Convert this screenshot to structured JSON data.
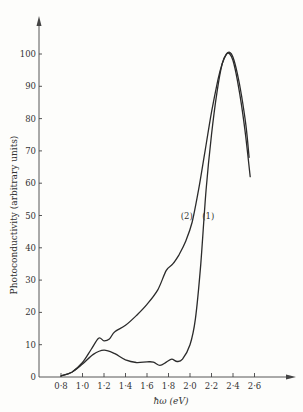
{
  "chart_data": {
    "type": "line",
    "title": "",
    "xlabel": "ħω (eV)",
    "ylabel": "Photoconductivity (arbitrary units)",
    "xlim": [
      0.7,
      2.9
    ],
    "ylim": [
      0,
      110
    ],
    "grid": false,
    "legend": "inline labels near curves",
    "x_ticks": [
      0.8,
      1.0,
      1.2,
      1.4,
      1.6,
      1.8,
      2.0,
      2.2,
      2.4,
      2.6
    ],
    "x_tick_labels": [
      "0·8",
      "1·0",
      "1·2",
      "1·4",
      "1·6",
      "1·8",
      "2·0",
      "2·2",
      "2·4",
      "2·6"
    ],
    "y_ticks": [
      0,
      10,
      20,
      30,
      40,
      50,
      60,
      70,
      80,
      90,
      100
    ],
    "y_tick_labels": [
      "0",
      "10",
      "20",
      "30",
      "40",
      "50",
      "60",
      "70",
      "80",
      "90",
      "100"
    ],
    "series": [
      {
        "name": "(1)",
        "label_pos": {
          "x": 2.17,
          "y": 49
        },
        "x": [
          0.8,
          0.9,
          1.0,
          1.1,
          1.2,
          1.3,
          1.4,
          1.5,
          1.6,
          1.66,
          1.72,
          1.78,
          1.83,
          1.88,
          1.93,
          2.0,
          2.05,
          2.1,
          2.15,
          2.2,
          2.25,
          2.3,
          2.34,
          2.37,
          2.4,
          2.44,
          2.48,
          2.52,
          2.56
        ],
        "values": [
          0.3,
          1.5,
          4,
          7,
          8.3,
          7.2,
          5.3,
          4.5,
          4.7,
          4.6,
          3.6,
          4.6,
          5.5,
          4.8,
          5.5,
          10,
          18,
          35,
          58,
          75,
          88,
          97,
          100,
          100,
          98,
          92,
          84,
          74,
          62
        ]
      },
      {
        "name": "(2)",
        "label_pos": {
          "x": 1.97,
          "y": 49
        },
        "x": [
          0.8,
          0.9,
          1.0,
          1.08,
          1.15,
          1.2,
          1.25,
          1.3,
          1.4,
          1.5,
          1.6,
          1.7,
          1.78,
          1.84,
          1.9,
          1.96,
          2.02,
          2.08,
          2.14,
          2.2,
          2.26,
          2.3,
          2.34,
          2.37,
          2.4,
          2.44,
          2.48,
          2.52,
          2.55
        ],
        "values": [
          0.3,
          1.5,
          4.5,
          8.5,
          12,
          11.2,
          11.8,
          14,
          16,
          19,
          22.5,
          27,
          33,
          35,
          38,
          42,
          48,
          58,
          70,
          82,
          92,
          97,
          100,
          100.5,
          99,
          94,
          87,
          78,
          68
        ]
      }
    ]
  }
}
